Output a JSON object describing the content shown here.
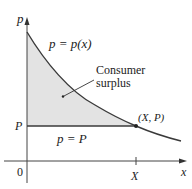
{
  "diagram": {
    "title": "Consumer surplus",
    "axes": {
      "y_label": "p",
      "x_label": "x",
      "origin_label": "0",
      "x_tick_label": "X",
      "y_tick_label": "P"
    },
    "curve": {
      "label": "p = p(x)",
      "type": "demand-curve",
      "color": "#3a3a3a"
    },
    "price_line": {
      "label": "p = P",
      "color": "#3a3a3a"
    },
    "point": {
      "label": "(X, P)"
    },
    "region": {
      "label_line1": "Consumer",
      "label_line2": "surplus",
      "fill_color": "#e3e3e3"
    }
  }
}
